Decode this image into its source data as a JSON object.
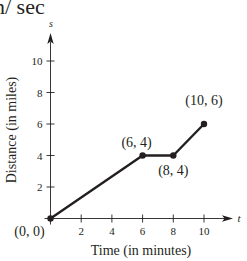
{
  "header_fragment": "n/ sec",
  "chart_data": {
    "type": "line",
    "title": "",
    "xlabel": "Time (in minutes)",
    "ylabel": "Distance (in miles)",
    "x_axis_var": "t",
    "y_axis_var": "s",
    "xlim": [
      0,
      10
    ],
    "ylim": [
      0,
      10
    ],
    "x_ticks": [
      2,
      4,
      6,
      8,
      10
    ],
    "y_ticks": [
      2,
      4,
      6,
      8,
      10
    ],
    "grid": false,
    "legend": null,
    "series": [
      {
        "name": "distance",
        "x": [
          0,
          6,
          8,
          10
        ],
        "y": [
          0,
          4,
          4,
          6
        ]
      }
    ],
    "annotations": [
      {
        "text": "(0, 0)",
        "x": 0,
        "y": 0,
        "position": "below-left"
      },
      {
        "text": "(6, 4)",
        "x": 6,
        "y": 4,
        "position": "above-left"
      },
      {
        "text": "(8, 4)",
        "x": 8,
        "y": 4,
        "position": "below"
      },
      {
        "text": "(10, 6)",
        "x": 10,
        "y": 6,
        "position": "above"
      }
    ]
  },
  "colors": {
    "ink": "#231f20",
    "background": "#ffffff"
  }
}
